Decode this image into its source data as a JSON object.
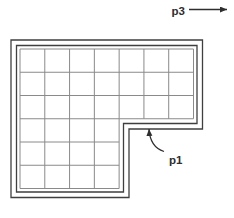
{
  "labels": {
    "p1": "p1",
    "p3": "p3"
  },
  "colors": {
    "background": "#ffffff",
    "wall": "#3f3f3f",
    "grid": "#8a8a8a",
    "text": "#2e2e2e",
    "arrow": "#2e2e2e"
  },
  "diagram": {
    "canvas": {
      "width": 234,
      "height": 218
    },
    "outer_polygon": [
      [
        11,
        40
      ],
      [
        202.5,
        40
      ],
      [
        202.5,
        129
      ],
      [
        129,
        129
      ],
      [
        129,
        197.5
      ],
      [
        11,
        197.5
      ]
    ],
    "inner_polygon": [
      [
        16.5,
        45.5
      ],
      [
        197,
        45.5
      ],
      [
        197,
        123.5
      ],
      [
        123.5,
        123.5
      ],
      [
        123.5,
        192
      ],
      [
        16.5,
        192
      ]
    ],
    "tile_polygon": [
      [
        20,
        49
      ],
      [
        193.5,
        49
      ],
      [
        193.5,
        118.75
      ],
      [
        119.14,
        118.75
      ],
      [
        119.14,
        188.5
      ],
      [
        20,
        188.5
      ]
    ],
    "grid": {
      "cols": 7,
      "rows": 6,
      "x0": 20,
      "x1": 193.5,
      "y0": 49,
      "y1": 188.5,
      "step_x": 119.14,
      "step_y": 118.75
    },
    "p3_arrow": {
      "x1": 189,
      "y1": 9.5,
      "x2": 227,
      "y2": 9.5
    },
    "p1_arrow": {
      "path": "M164,151.5 Q150,147 149,129"
    },
    "p3_label_pos": {
      "x": 171.5,
      "y": 14.5
    },
    "p1_label_pos": {
      "x": 169,
      "y": 163.5
    }
  }
}
